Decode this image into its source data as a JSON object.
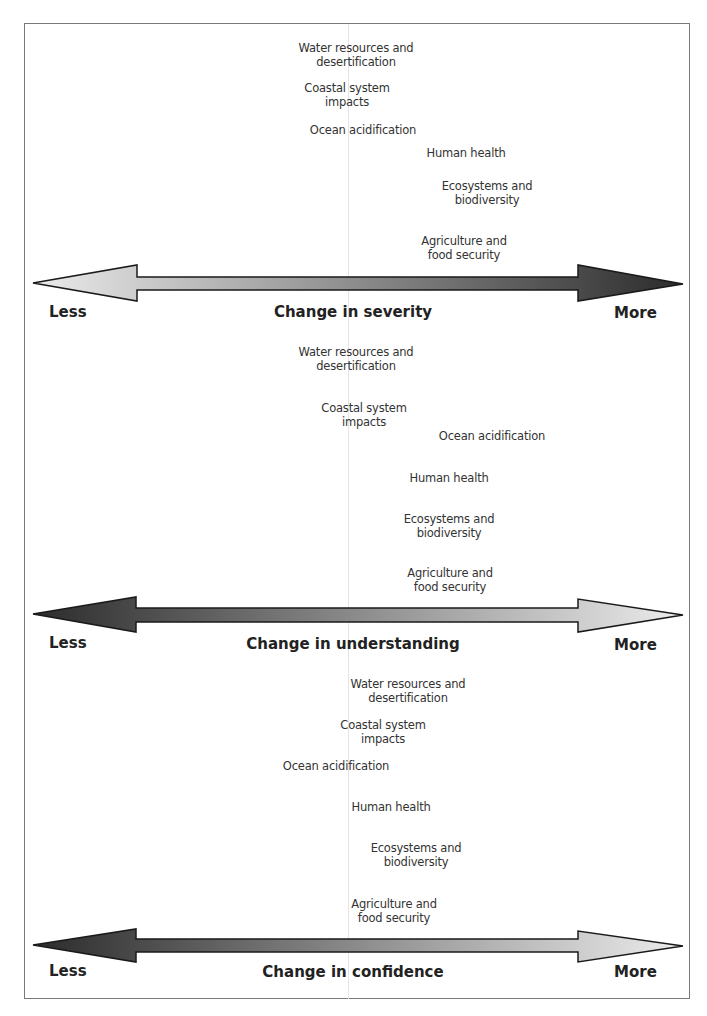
{
  "figure": {
    "panels": [
      {
        "axis_title": "Change in severity",
        "less_label": "Less",
        "more_label": "More",
        "arrow_direction_dark": "right",
        "items": [
          {
            "label": "Water resources and\ndesertification",
            "x": 356,
            "y": 41
          },
          {
            "label": "Coastal system\nimpacts",
            "x": 347,
            "y": 81
          },
          {
            "label": "Ocean acidification",
            "x": 363,
            "y": 123
          },
          {
            "label": "Human health",
            "x": 466,
            "y": 146
          },
          {
            "label": "Ecosystems and\nbiodiversity",
            "x": 487,
            "y": 179
          },
          {
            "label": "Agriculture and\nfood security",
            "x": 464,
            "y": 234
          }
        ]
      },
      {
        "axis_title": "Change in understanding",
        "less_label": "Less",
        "more_label": "More",
        "arrow_direction_dark": "left",
        "items": [
          {
            "label": "Water resources and\ndesertification",
            "x": 356,
            "y": 345
          },
          {
            "label": "Coastal system\nimpacts",
            "x": 364,
            "y": 401
          },
          {
            "label": "Ocean acidification",
            "x": 492,
            "y": 429
          },
          {
            "label": "Human health",
            "x": 449,
            "y": 471
          },
          {
            "label": "Ecosystems and\nbiodiversity",
            "x": 449,
            "y": 512
          },
          {
            "label": "Agriculture and\nfood security",
            "x": 450,
            "y": 566
          }
        ]
      },
      {
        "axis_title": "Change in confidence",
        "less_label": "Less",
        "more_label": "More",
        "arrow_direction_dark": "left",
        "items": [
          {
            "label": "Water resources and\ndesertification",
            "x": 408,
            "y": 677
          },
          {
            "label": "Coastal system\nimpacts",
            "x": 383,
            "y": 718
          },
          {
            "label": "Ocean acidification",
            "x": 336,
            "y": 759
          },
          {
            "label": "Human health",
            "x": 391,
            "y": 800
          },
          {
            "label": "Ecosystems and\nbiodiversity",
            "x": 416,
            "y": 841
          },
          {
            "label": "Agriculture and\nfood security",
            "x": 394,
            "y": 897
          }
        ]
      }
    ]
  },
  "colors": {
    "light": "#e4e4e4",
    "dark": "#2b2b2b",
    "text": "#333333",
    "frame": "#7a7a7a"
  }
}
